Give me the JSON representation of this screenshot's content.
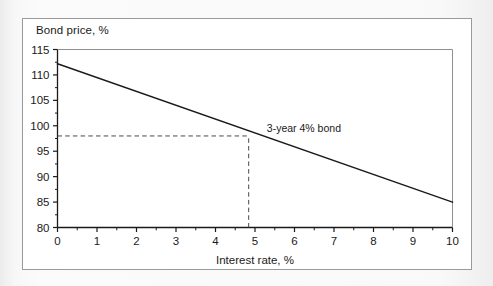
{
  "figure": {
    "background_color": "#f4f4f4",
    "panel_color": "#ffffff",
    "border_color": "#9a9a9a"
  },
  "chart_data": {
    "type": "line",
    "title": "",
    "xlabel": "Interest rate, %",
    "ylabel": "Bond price, %",
    "xlim": [
      0,
      10
    ],
    "ylim": [
      80,
      115
    ],
    "xticks": [
      0,
      1,
      2,
      3,
      4,
      5,
      6,
      7,
      8,
      9,
      10
    ],
    "xtick_labels": [
      "0",
      "1",
      "2",
      "3",
      "4",
      "5",
      "6",
      "7",
      "8",
      "9",
      "10"
    ],
    "xminor_ticks": [
      0.5,
      1.5,
      2.5,
      3.5,
      4.5,
      5.5,
      6.5,
      7.5,
      8.5,
      9.5
    ],
    "yticks": [
      80,
      85,
      90,
      95,
      100,
      105,
      110,
      115
    ],
    "ytick_labels": [
      "80",
      "85",
      "90",
      "95",
      "100",
      "105",
      "110",
      "115"
    ],
    "yminor_ticks": [
      82.5,
      87.5,
      92.5,
      97.5,
      102.5,
      107.5,
      112.5
    ],
    "grid": false,
    "legend": null,
    "series": [
      {
        "name": "3-year 4% bond",
        "color": "#1a1a1a",
        "line_width": 1.4,
        "x": [
          0,
          10
        ],
        "values": [
          112.2,
          85.0
        ]
      }
    ],
    "annotations": [
      {
        "text": "3-year 4% bond",
        "x": 5.3,
        "y": 98.8,
        "type": "series-label"
      }
    ],
    "guide_lines": [
      {
        "type": "horizontal",
        "style": "dashed",
        "color": "#4a4a4a",
        "y": 98.0,
        "x_from": 0,
        "x_to": 4.84
      },
      {
        "type": "vertical",
        "style": "dashed",
        "color": "#4a4a4a",
        "x": 4.84,
        "y_from": 80,
        "y_to": 98.0
      }
    ],
    "intersection_point": {
      "x": 4.84,
      "y": 98.0
    },
    "axis_color": "#1a1a1a"
  }
}
